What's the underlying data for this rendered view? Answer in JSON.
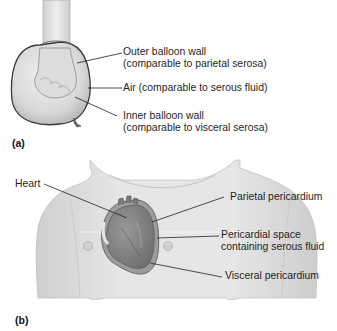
{
  "figure": {
    "panel_a": {
      "letter": "(a)",
      "subject": "fist pushed into balloon",
      "labels": [
        {
          "line1": "Outer balloon wall",
          "line2": "(comparable to parietal serosa)"
        },
        {
          "line1": "Air (comparable to serous fluid)"
        },
        {
          "line1": "Inner balloon wall",
          "line2": "(comparable to visceral serosa)"
        }
      ]
    },
    "panel_b": {
      "letter": "(b)",
      "subject": "heart within pericardium in thorax",
      "labels": [
        {
          "line1": "Heart"
        },
        {
          "line1": "Parietal pericardium"
        },
        {
          "line1": "Pericardial space",
          "line2": "containing serous fluid"
        },
        {
          "line1": "Visceral pericardium"
        }
      ]
    },
    "colors": {
      "skin": "#e4e4e4",
      "skin_shadow": "#c9c9c9",
      "outline": "#7a7a7a",
      "heart": "#7e7e7e",
      "leader_line": "#222222"
    }
  }
}
